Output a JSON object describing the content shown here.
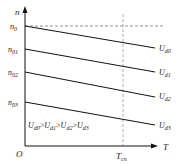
{
  "diagram": {
    "type": "line-diagram",
    "axes": {
      "y_label": "n",
      "x_label": "T",
      "origin_label": "O"
    },
    "marker": {
      "x_label": "T",
      "x_label_sub": "cn"
    },
    "y_ticks": [
      {
        "main": "n",
        "sub": "0"
      },
      {
        "main": "n",
        "sub": "01"
      },
      {
        "main": "n",
        "sub": "02"
      },
      {
        "main": "n",
        "sub": "03"
      }
    ],
    "lines": [
      {
        "main": "U",
        "sub": "d0"
      },
      {
        "main": "U",
        "sub": "d1"
      },
      {
        "main": "U",
        "sub": "d2"
      },
      {
        "main": "U",
        "sub": "d3"
      }
    ],
    "relation": {
      "terms": [
        {
          "main": "U",
          "sub": "d0"
        },
        {
          "main": "U",
          "sub": "d1"
        },
        {
          "main": "U",
          "sub": "d2"
        },
        {
          "main": "U",
          "sub": "d3"
        }
      ],
      "op": ">"
    },
    "colors": {
      "line": "#111111",
      "dashed": "#888888"
    }
  }
}
